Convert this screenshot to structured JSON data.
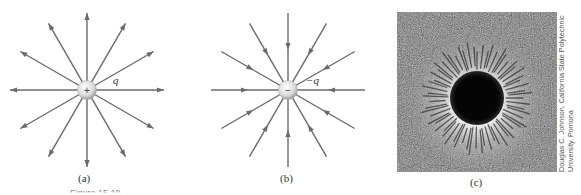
{
  "figure": {
    "panels": [
      {
        "id": "a",
        "label": "(a)",
        "charge_label": "q",
        "charge_sign": "+",
        "field_line_count": 12,
        "arrow_direction": "outward"
      },
      {
        "id": "b",
        "label": "(b)",
        "charge_label": "−q",
        "charge_sign": "−",
        "field_line_count": 12,
        "arrow_direction": "inward"
      },
      {
        "id": "c",
        "label": "(c)",
        "description": "photograph of field pattern around a charged sphere",
        "credit_line1": "Douglas C. Johnson, California State Polytechnic",
        "credit_line2": "University, Pomona"
      }
    ],
    "caption_clipped": "Figure 15.10"
  },
  "colors": {
    "line": "#6b6b6b",
    "charge_fill": "#d9d9d9",
    "label_text": "#333333"
  }
}
